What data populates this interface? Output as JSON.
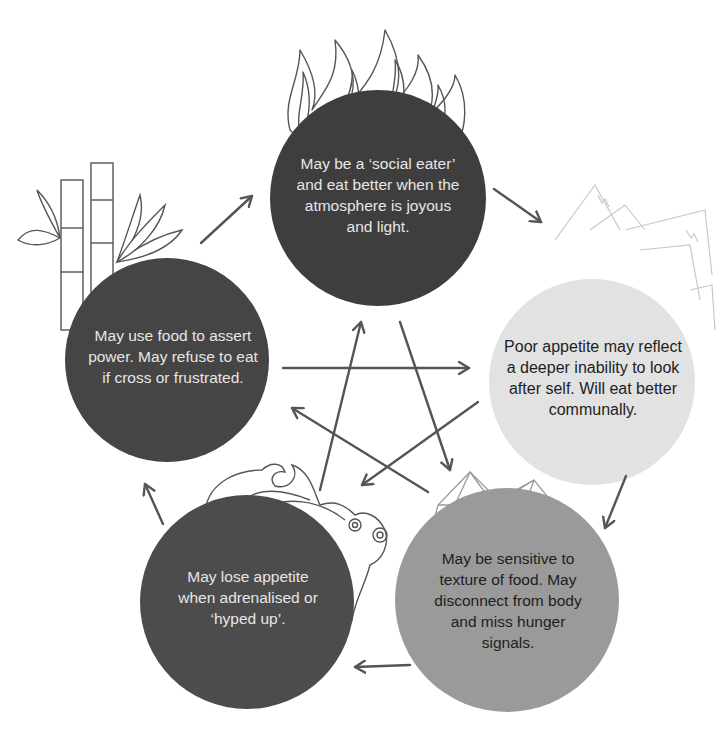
{
  "diagram": {
    "type": "five-element-cycle",
    "colors": {
      "fire": "#3e3e3e",
      "wood": "#454545",
      "earth": "#e2e2e2",
      "water": "#4c4c4c",
      "metal": "#9a9a9a",
      "arrow": "#555555",
      "line_art": "#555555",
      "line_art_light": "#c8c8c8"
    },
    "nodes": [
      {
        "id": "fire",
        "illustration": "flames-icon",
        "text": "May be a ‘social eater’ and eat better when the atmosphere is joyous and light."
      },
      {
        "id": "earth",
        "illustration": "mountains-icon",
        "text": "Poor appetite may reflect a deeper inability to look after self. Will eat better communally."
      },
      {
        "id": "metal",
        "illustration": "crystal-icon",
        "text": "May be sensitive to texture of food. May disconnect from body and miss hunger signals."
      },
      {
        "id": "water",
        "illustration": "waves-icon",
        "text": "May lose appetite when adrenalised or ‘hyped up’."
      },
      {
        "id": "wood",
        "illustration": "bamboo-icon",
        "text": "May use food to assert power. May refuse to eat if cross or frustrated."
      }
    ],
    "outer_cycle": [
      "wood → fire",
      "fire → earth",
      "earth → metal",
      "metal → water",
      "water → wood"
    ],
    "inner_star": [
      "wood → earth",
      "earth → water",
      "water → fire",
      "fire → metal",
      "metal → wood"
    ]
  }
}
